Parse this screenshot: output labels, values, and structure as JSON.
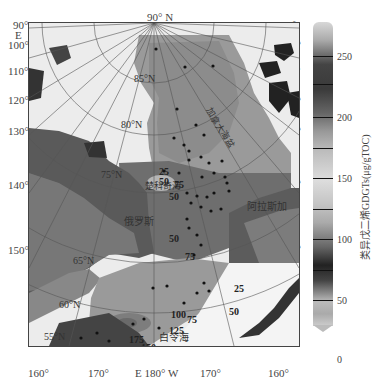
{
  "map": {
    "pole_label": "90° N",
    "left_axis": [
      "90°",
      "E",
      "100°",
      "110°",
      "120°",
      "130°",
      "140°",
      "150°"
    ],
    "right_axis": [
      "90°",
      "W",
      "100°",
      "110°",
      "120°",
      "130°",
      "140°",
      "150°"
    ],
    "bottom_axis": [
      "160°",
      "170°",
      "E  180° W",
      "170°",
      "160°"
    ],
    "latitude_labels": [
      "85°N",
      "80°N",
      "75°N",
      "65°N",
      "60°N",
      "55°N"
    ],
    "region_labels": {
      "canada_basin": "加拿大海盆",
      "chukchi": "楚科奇海",
      "alaska": "阿拉斯加",
      "russia": "俄罗斯",
      "bering": "白令海"
    },
    "contour_labels": [
      "25",
      "50",
      "75",
      "50",
      "50",
      "75",
      "25",
      "50",
      "75",
      "100",
      "125",
      "175",
      "150",
      "100",
      "75",
      "50"
    ]
  },
  "colorbar": {
    "ticks": [
      "250",
      "200",
      "150",
      "100",
      "50",
      "0"
    ],
    "title": "类异戊二烯GDGTs(μg/gTOC)",
    "range": [
      0,
      270
    ]
  }
}
